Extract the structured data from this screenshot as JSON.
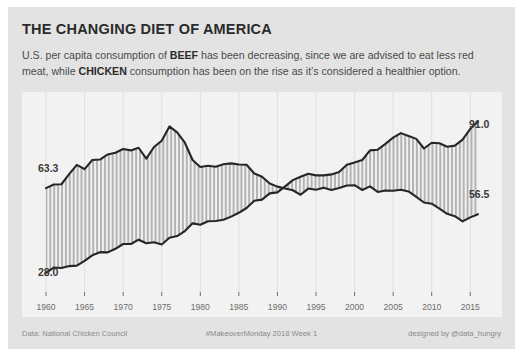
{
  "card": {
    "title": "THE CHANGING DIET OF AMERICA",
    "subtitle_part1": "U.S. per capita consumption of ",
    "subtitle_bold1": "BEEF",
    "subtitle_part2": " has been decreasing, since we are advised to eat less red meat, while ",
    "subtitle_bold2": "CHICKEN",
    "subtitle_part3": " consumption has been on the rise as it’s considered a healthier option."
  },
  "footer": {
    "source": "Data: National Chicken Council",
    "center": "#MakeoverMonday 2018 Week 1",
    "credit": "designed by @data_hungry"
  },
  "labels": {
    "beef_start": "63.3",
    "beef_end": "56.5",
    "chicken_start": "28.0",
    "chicken_end": "91.0"
  },
  "colors": {
    "card_background": "#e3e3e3",
    "plot_background": "#f2f2f2",
    "line": "#262626",
    "band_stripe": "#b0b0b0",
    "gridline": "#e0e0e0",
    "tick_text": "#6d6d6d",
    "title_text": "#2b2b2b"
  },
  "chart_data": {
    "type": "line",
    "title": "THE CHANGING DIET OF AMERICA",
    "xlabel": "",
    "ylabel": "",
    "xlim": [
      1960,
      2016
    ],
    "ylim": [
      20,
      100
    ],
    "grid": true,
    "legend": "none",
    "xtick_labels": [
      "1960",
      "1965",
      "1970",
      "1975",
      "1980",
      "1985",
      "1990",
      "1995",
      "2000",
      "2005",
      "2010",
      "2015"
    ],
    "xticks": [
      1960,
      1965,
      1970,
      1975,
      1980,
      1985,
      1990,
      1995,
      2000,
      2005,
      2010,
      2015
    ],
    "x": [
      1960,
      1961,
      1962,
      1963,
      1964,
      1965,
      1966,
      1967,
      1968,
      1969,
      1970,
      1971,
      1972,
      1973,
      1974,
      1975,
      1976,
      1977,
      1978,
      1979,
      1980,
      1981,
      1982,
      1983,
      1984,
      1985,
      1986,
      1987,
      1988,
      1989,
      1990,
      1991,
      1992,
      1993,
      1994,
      1995,
      1996,
      1997,
      1998,
      1999,
      2000,
      2001,
      2002,
      2003,
      2004,
      2005,
      2006,
      2007,
      2008,
      2009,
      2010,
      2011,
      2012,
      2013,
      2014,
      2015,
      2016
    ],
    "series": [
      {
        "name": "BEEF",
        "annotation_start": "63.3",
        "annotation_end": "56.5",
        "values": [
          63.3,
          64.8,
          64.9,
          69.1,
          73.0,
          71.2,
          75.0,
          75.2,
          77.3,
          78.0,
          79.6,
          79.0,
          80.1,
          75.6,
          80.4,
          83.0,
          89.0,
          86.5,
          82.2,
          75.0,
          72.1,
          72.6,
          72.2,
          73.2,
          73.6,
          73.1,
          73.0,
          69.4,
          68.0,
          65.2,
          63.9,
          63.1,
          62.4,
          60.5,
          63.1,
          62.6,
          63.4,
          62.5,
          63.3,
          64.4,
          64.5,
          62.5,
          64.0,
          61.7,
          62.3,
          62.2,
          62.6,
          61.9,
          59.6,
          57.3,
          56.8,
          54.7,
          52.6,
          51.6,
          49.4,
          51.1,
          52.4
        ]
      },
      {
        "name": "CHICKEN",
        "annotation_start": "28.0",
        "annotation_end": "91.0",
        "values": [
          28.0,
          30.2,
          30.0,
          30.8,
          31.0,
          33.0,
          35.3,
          36.6,
          36.5,
          38.0,
          40.0,
          40.0,
          41.8,
          40.3,
          40.7,
          39.8,
          42.6,
          43.3,
          45.4,
          48.6,
          48.0,
          49.5,
          49.6,
          50.1,
          51.4,
          53.0,
          55.0,
          58.0,
          58.5,
          61.1,
          61.5,
          64.0,
          66.6,
          68.0,
          69.3,
          68.6,
          68.6,
          69.0,
          70.0,
          73.0,
          74.0,
          75.0,
          79.0,
          79.3,
          81.7,
          84.3,
          86.2,
          85.0,
          83.8,
          79.8,
          82.2,
          82.0,
          80.5,
          81.0,
          83.5,
          88.0,
          91.0
        ]
      }
    ]
  }
}
